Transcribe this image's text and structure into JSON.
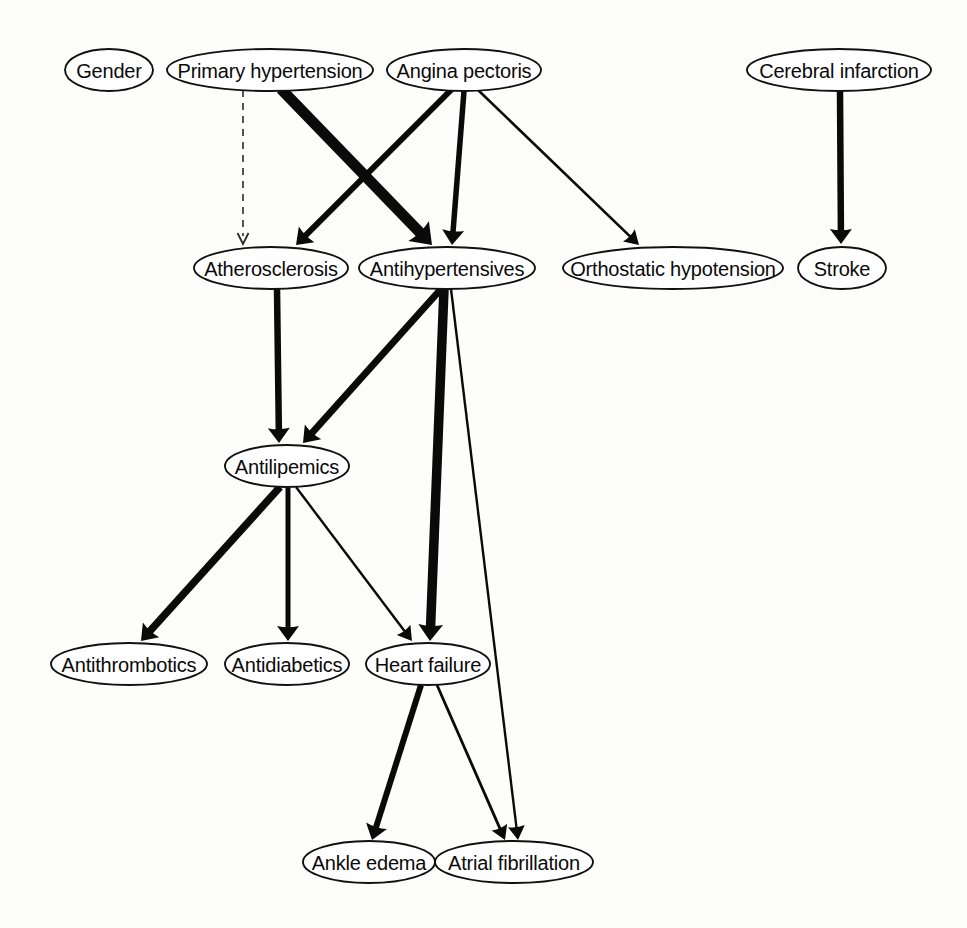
{
  "diagram": {
    "type": "directed-graph",
    "title": "",
    "background_color": "#fdfdfc",
    "stroke_color": "#0a0a0a",
    "node_fill": "#ffffff",
    "nodes": [
      {
        "id": "gender",
        "label": "Gender",
        "cx": 109,
        "cy": 70,
        "rx": 44,
        "ry": 21
      },
      {
        "id": "primary_htn",
        "label": "Primary hypertension",
        "cx": 270,
        "cy": 70,
        "rx": 103,
        "ry": 21
      },
      {
        "id": "angina",
        "label": "Angina pectoris",
        "cx": 464,
        "cy": 70,
        "rx": 77,
        "ry": 21
      },
      {
        "id": "cerebral_inf",
        "label": "Cerebral infarction",
        "cx": 839,
        "cy": 70,
        "rx": 92,
        "ry": 21
      },
      {
        "id": "athero",
        "label": "Atherosclerosis",
        "cx": 271,
        "cy": 268,
        "rx": 77,
        "ry": 21
      },
      {
        "id": "antihtn",
        "label": "Antihypertensives",
        "cx": 447,
        "cy": 268,
        "rx": 88,
        "ry": 21
      },
      {
        "id": "ortho_hypo",
        "label": "Orthostatic hypotension",
        "cx": 673,
        "cy": 268,
        "rx": 110,
        "ry": 21
      },
      {
        "id": "stroke",
        "label": "Stroke",
        "cx": 842,
        "cy": 268,
        "rx": 44,
        "ry": 21
      },
      {
        "id": "antilip",
        "label": "Antilipemics",
        "cx": 287,
        "cy": 466,
        "rx": 62,
        "ry": 21
      },
      {
        "id": "antithrom",
        "label": "Antithrombotics",
        "cx": 129,
        "cy": 664,
        "rx": 78,
        "ry": 21
      },
      {
        "id": "antidiab",
        "label": "Antidiabetics",
        "cx": 287,
        "cy": 664,
        "rx": 62,
        "ry": 21
      },
      {
        "id": "heart_failure",
        "label": "Heart failure",
        "cx": 428,
        "cy": 664,
        "rx": 62,
        "ry": 21
      },
      {
        "id": "ankle_edema",
        "label": "Ankle edema",
        "cx": 369,
        "cy": 862,
        "rx": 66,
        "ry": 21
      },
      {
        "id": "atrial_fib",
        "label": "Atrial fibrillation",
        "cx": 514,
        "cy": 862,
        "rx": 79,
        "ry": 21
      }
    ],
    "edges": [
      {
        "from": "primary_htn",
        "to": "athero",
        "x1": 243,
        "y1": 90,
        "x2": 243,
        "y2": 244,
        "width": 1.6,
        "style": "dashed",
        "arrow": "thin"
      },
      {
        "from": "primary_htn",
        "to": "antihtn",
        "x1": 281,
        "y1": 89,
        "x2": 432,
        "y2": 245,
        "width": 11.0,
        "style": "solid",
        "arrow": "thick"
      },
      {
        "from": "angina",
        "to": "athero",
        "x1": 452,
        "y1": 89,
        "x2": 296,
        "y2": 245,
        "width": 6.0,
        "style": "solid",
        "arrow": "thick"
      },
      {
        "from": "angina",
        "to": "antihtn",
        "x1": 464,
        "y1": 91,
        "x2": 452,
        "y2": 245,
        "width": 5.5,
        "style": "solid",
        "arrow": "thick"
      },
      {
        "from": "angina",
        "to": "ortho_hypo",
        "x1": 477,
        "y1": 89,
        "x2": 639,
        "y2": 245,
        "width": 2.6,
        "style": "solid",
        "arrow": "thin"
      },
      {
        "from": "cerebral_inf",
        "to": "stroke",
        "x1": 840,
        "y1": 91,
        "x2": 841,
        "y2": 244,
        "width": 6.5,
        "style": "solid",
        "arrow": "thick"
      },
      {
        "from": "athero",
        "to": "antilip",
        "x1": 277,
        "y1": 289,
        "x2": 279,
        "y2": 443,
        "width": 6.5,
        "style": "solid",
        "arrow": "thick"
      },
      {
        "from": "antihtn",
        "to": "antilip",
        "x1": 441,
        "y1": 289,
        "x2": 303,
        "y2": 443,
        "width": 7.0,
        "style": "solid",
        "arrow": "thick"
      },
      {
        "from": "antihtn",
        "to": "heart_failure",
        "x1": 444,
        "y1": 289,
        "x2": 430,
        "y2": 641,
        "width": 9.5,
        "style": "solid",
        "arrow": "thick"
      },
      {
        "from": "antihtn",
        "to": "atrial_fib",
        "x1": 451,
        "y1": 289,
        "x2": 518,
        "y2": 840,
        "width": 2.4,
        "style": "solid",
        "arrow": "thin"
      },
      {
        "from": "antilip",
        "to": "antithrom",
        "x1": 280,
        "y1": 487,
        "x2": 141,
        "y2": 641,
        "width": 7.5,
        "style": "solid",
        "arrow": "thick"
      },
      {
        "from": "antilip",
        "to": "antidiab",
        "x1": 288,
        "y1": 488,
        "x2": 288,
        "y2": 641,
        "width": 5.0,
        "style": "solid",
        "arrow": "thick"
      },
      {
        "from": "antilip",
        "to": "heart_failure",
        "x1": 296,
        "y1": 487,
        "x2": 412,
        "y2": 641,
        "width": 2.4,
        "style": "solid",
        "arrow": "thin"
      },
      {
        "from": "heart_failure",
        "to": "ankle_edema",
        "x1": 421,
        "y1": 685,
        "x2": 372,
        "y2": 840,
        "width": 6.0,
        "style": "solid",
        "arrow": "thick"
      },
      {
        "from": "heart_failure",
        "to": "atrial_fib",
        "x1": 437,
        "y1": 685,
        "x2": 505,
        "y2": 840,
        "width": 2.8,
        "style": "solid",
        "arrow": "thin"
      }
    ]
  }
}
